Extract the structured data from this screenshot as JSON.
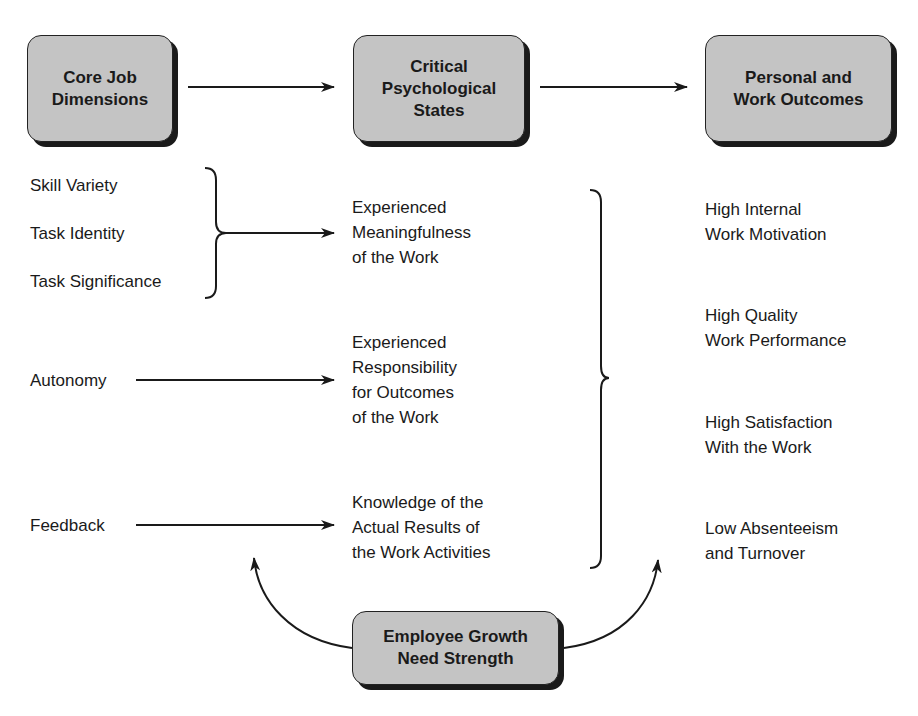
{
  "headers": {
    "core": "Core Job\nDimensions",
    "states": "Critical\nPsychological\nStates",
    "outcomes": "Personal and\nWork Outcomes"
  },
  "dimensions": [
    "Skill Variety",
    "Task Identity",
    "Task Significance",
    "Autonomy",
    "Feedback"
  ],
  "states": [
    "Experienced\nMeaningfulness\nof the Work",
    "Experienced\nResponsibility\nfor Outcomes\nof the Work",
    "Knowledge of the\nActual Results of\nthe Work Activities"
  ],
  "outcomes": [
    "High Internal\nWork Motivation",
    "High Quality\nWork Performance",
    "High Satisfaction\nWith the Work",
    "Low Absenteeism\nand Turnover"
  ],
  "moderator": "Employee Growth\nNeed Strength",
  "colors": {
    "box_fill": "#c4c4c4",
    "line": "#1a1a1a"
  }
}
